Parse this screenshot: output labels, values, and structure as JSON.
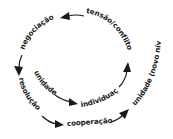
{
  "diagram": {
    "type": "spiral-cycle",
    "colors": {
      "ink": "#1a1a1a",
      "background": "#ffffff"
    },
    "labels": {
      "tension": "tensão/conflito",
      "negotiation": "negociação",
      "resolution": "resolução",
      "cooperation": "cooperação",
      "unity_new_level": "unidade (novo nível)",
      "unity": "unidade",
      "individuation": "individuação"
    },
    "sequence": [
      "unidade",
      "individuação",
      "tensão/conflito",
      "negociação",
      "resolução",
      "cooperação",
      "unidade (novo nível)"
    ]
  }
}
